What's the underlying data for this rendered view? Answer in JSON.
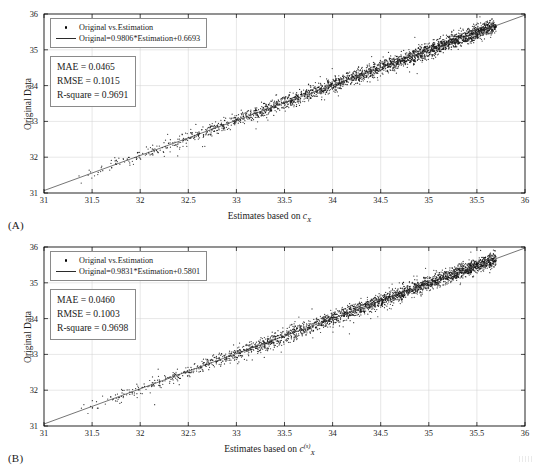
{
  "figure": {
    "background": "#ffffff",
    "panels": [
      {
        "tag": "(A)",
        "legend": {
          "marker_label": "Original vs.Estimation",
          "line_label": "Original=0.9806*Estimation+0.6693"
        },
        "stats": {
          "mae": "MAE = 0.0465",
          "rmse": "RMSE = 0.1015",
          "r_square": "R-square = 0.9691"
        },
        "xlabel_prefix": "Estimates based on ",
        "xlabel_var": "c",
        "xlabel_sub": "X",
        "xlabel_sup": "",
        "ylabel": "Original Data"
      },
      {
        "tag": "(B)",
        "legend": {
          "marker_label": "Original vs.Estimation",
          "line_label": "Original=0.9831*Estimation+0.5801"
        },
        "stats": {
          "mae": "MAE = 0.0460",
          "rmse": "RMSE = 0.1003",
          "r_square": "R-square = 0.9698"
        },
        "xlabel_prefix": "Estimates based on ",
        "xlabel_var": "c",
        "xlabel_sub": "X",
        "xlabel_sup": "(s)",
        "ylabel": "Original Data"
      }
    ]
  },
  "chart_data": [
    {
      "type": "scatter",
      "panel": "(A)",
      "title": "",
      "xlabel": "Estimates based on c_X",
      "ylabel": "Original Data",
      "xlim": [
        31,
        36
      ],
      "ylim": [
        31,
        36
      ],
      "xticks": [
        31,
        31.5,
        32,
        32.5,
        33,
        33.5,
        34,
        34.5,
        35,
        35.5,
        36
      ],
      "yticks": [
        31,
        32,
        33,
        34,
        35,
        36
      ],
      "xticklabels": [
        "31",
        "31.5",
        "32",
        "32.5",
        "33",
        "33.5",
        "34",
        "34.5",
        "35",
        "35.5",
        "36"
      ],
      "yticklabels": [
        "31",
        "32",
        "33",
        "34",
        "35",
        "36"
      ],
      "grid": true,
      "legend_position": "upper-left",
      "marker_color": "#111111",
      "line_color": "#3a3a3a",
      "fit_line": {
        "label": "Original=0.9806*Estimation+0.6693",
        "slope": 0.9806,
        "intercept": 0.6693
      },
      "metrics": {
        "MAE": 0.0465,
        "RMSE": 0.1015,
        "R_square": 0.9691
      },
      "n_points": 2600,
      "noise_sigma": 0.1015,
      "density_profile": "right-skewed; sparse below 32.5, dense above 33.5, peak near 34.6",
      "series_name": "Original vs.Estimation"
    },
    {
      "type": "scatter",
      "panel": "(B)",
      "title": "",
      "xlabel": "Estimates based on c_X^(s)",
      "ylabel": "Original Data",
      "xlim": [
        31,
        36
      ],
      "ylim": [
        31,
        36
      ],
      "xticks": [
        31,
        31.5,
        32,
        32.5,
        33,
        33.5,
        34,
        34.5,
        35,
        35.5,
        36
      ],
      "yticks": [
        31,
        32,
        33,
        34,
        35,
        36
      ],
      "xticklabels": [
        "31",
        "31.5",
        "32",
        "32.5",
        "33",
        "33.5",
        "34",
        "34.5",
        "35",
        "35.5",
        "36"
      ],
      "yticklabels": [
        "31",
        "32",
        "33",
        "34",
        "35",
        "36"
      ],
      "grid": true,
      "legend_position": "upper-left",
      "marker_color": "#111111",
      "line_color": "#3a3a3a",
      "fit_line": {
        "label": "Original=0.9831*Estimation+0.5801",
        "slope": 0.9831,
        "intercept": 0.5801
      },
      "metrics": {
        "MAE": 0.046,
        "RMSE": 0.1003,
        "R_square": 0.9698
      },
      "n_points": 2600,
      "noise_sigma": 0.1003,
      "density_profile": "right-skewed; sparse below 32.5, dense above 33.5, peak near 34.6",
      "series_name": "Original vs.Estimation"
    }
  ]
}
